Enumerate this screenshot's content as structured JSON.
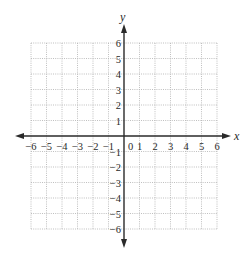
{
  "chart_data": {
    "type": "coordinate-grid",
    "title": "",
    "xlabel": "x",
    "ylabel": "y",
    "xlim": [
      -6,
      6
    ],
    "ylim": [
      -6,
      6
    ],
    "grid": true,
    "grid_style": "dotted",
    "x_ticks": [
      "-6",
      "-5",
      "-4",
      "-3",
      "-2",
      "-1",
      "0",
      "1",
      "2",
      "3",
      "4",
      "5",
      "6"
    ],
    "y_ticks": [
      "6",
      "5",
      "4",
      "3",
      "2",
      "1",
      "-1",
      "-2",
      "-3",
      "-4",
      "-5",
      "-6"
    ],
    "origin_label": "0",
    "series": []
  },
  "labels": {
    "x_axis": "x",
    "y_axis": "y",
    "origin": "0",
    "x_neg": [
      "−6",
      "−5",
      "−4",
      "−3",
      "−2",
      "−1"
    ],
    "x_pos": [
      "1",
      "2",
      "3",
      "4",
      "5",
      "6"
    ],
    "y_pos": [
      "6",
      "5",
      "4",
      "3",
      "2",
      "1"
    ],
    "y_neg": [
      "−1",
      "−2",
      "−3",
      "−4",
      "−5",
      "−6"
    ]
  },
  "colors": {
    "axis": "#2a2a2a",
    "grid": "#b8b8b8",
    "text": "#2a2a2a"
  }
}
